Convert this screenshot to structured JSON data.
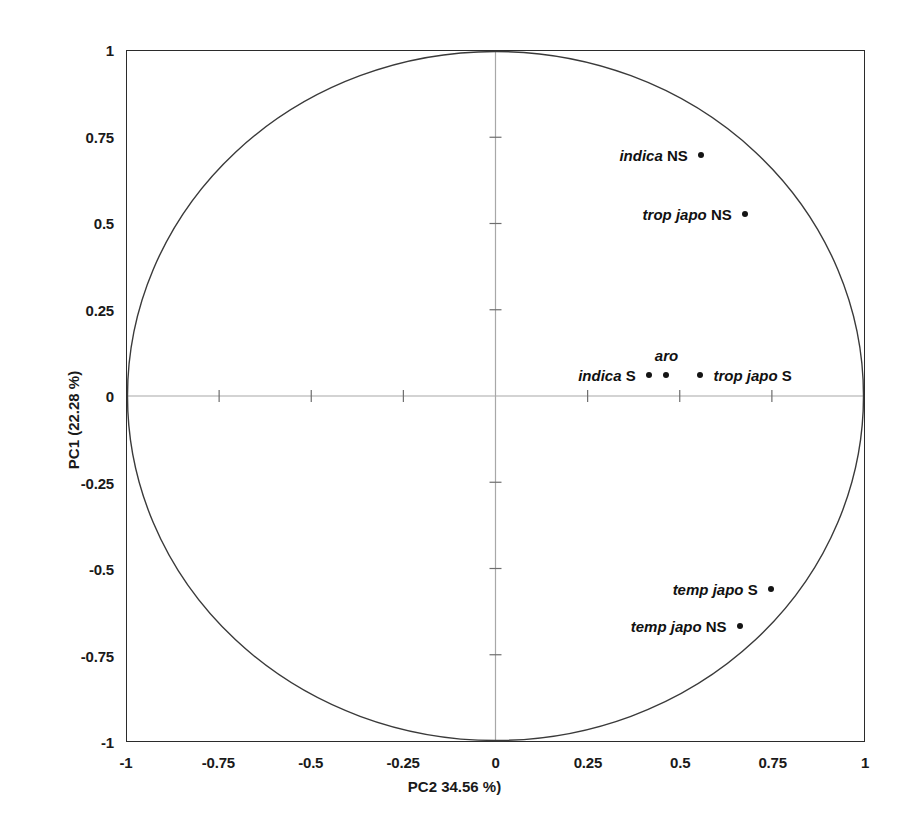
{
  "chart_data": {
    "type": "scatter",
    "title": "",
    "subtitle": "",
    "xlabel": "PC2 34.56 %)",
    "ylabel": "PC1 (22.28 %)",
    "xlim": [
      -1,
      1
    ],
    "ylim": [
      -1,
      1
    ],
    "grid": false,
    "legend": "none",
    "annotations": [
      "unit correlation circle of radius 1 centred at origin",
      "crosshair axes drawn at x=0 and y=0"
    ],
    "x_ticks": [
      {
        "value": -1,
        "label": "-1"
      },
      {
        "value": -0.75,
        "label": "-0.75"
      },
      {
        "value": -0.5,
        "label": "-0.5"
      },
      {
        "value": -0.25,
        "label": "-0.25"
      },
      {
        "value": 0,
        "label": "0"
      },
      {
        "value": 0.25,
        "label": "0.25"
      },
      {
        "value": 0.5,
        "label": "0.5"
      },
      {
        "value": 0.75,
        "label": "0.75"
      },
      {
        "value": 1,
        "label": "1"
      }
    ],
    "y_ticks": [
      {
        "value": 1,
        "label": "1"
      },
      {
        "value": 0.75,
        "label": "0.75"
      },
      {
        "value": 0.5,
        "label": "0.5"
      },
      {
        "value": 0.25,
        "label": "0.25"
      },
      {
        "value": 0,
        "label": "0"
      },
      {
        "value": -0.25,
        "label": "-0.25"
      },
      {
        "value": -0.5,
        "label": "-0.5"
      },
      {
        "value": -0.75,
        "label": "-0.75"
      },
      {
        "value": -1,
        "label": "-1"
      }
    ],
    "points": [
      {
        "name": "indica-ns",
        "taxon": "indica",
        "suffix": " NS",
        "x": 0.553,
        "y": 0.7,
        "label_side": "left"
      },
      {
        "name": "trop-japo-ns",
        "taxon": "trop japo",
        "suffix": " NS",
        "x": 0.672,
        "y": 0.53,
        "label_side": "left"
      },
      {
        "name": "aro",
        "taxon": "aro",
        "suffix": "",
        "x": 0.46,
        "y": 0.065,
        "label_side": "above"
      },
      {
        "name": "indica-s",
        "taxon": "indica",
        "suffix": " S",
        "x": 0.412,
        "y": 0.065,
        "label_side": "left"
      },
      {
        "name": "trop-japo-s",
        "taxon": "trop japo",
        "suffix": " S",
        "x": 0.552,
        "y": 0.065,
        "label_side": "right"
      },
      {
        "name": "temp-japo-s",
        "taxon": "temp japo",
        "suffix": " S",
        "x": 0.742,
        "y": -0.555,
        "label_side": "left"
      },
      {
        "name": "temp-japo-ns",
        "taxon": "temp japo",
        "suffix": " NS",
        "x": 0.658,
        "y": -0.662,
        "label_side": "left"
      }
    ]
  },
  "colors": {
    "frame": "#2b2b2b",
    "circle": "#3a3a3a",
    "crosshair": "#a8a8a8",
    "point": "#141414",
    "text": "#111111",
    "background": "#ffffff"
  }
}
